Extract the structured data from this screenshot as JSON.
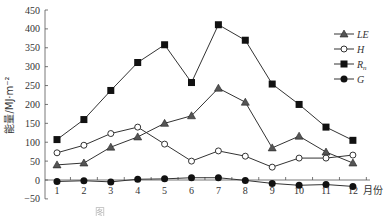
{
  "chart_data": {
    "type": "line",
    "title": "",
    "xlabel": "月份",
    "ylabel": "能量/MJ·m⁻²",
    "x": [
      1,
      2,
      3,
      4,
      5,
      6,
      7,
      8,
      9,
      10,
      11,
      12
    ],
    "categories": [
      "1",
      "2",
      "3",
      "4",
      "5",
      "6",
      "7",
      "8",
      "9",
      "10",
      "11",
      "12"
    ],
    "ylim": [
      -50,
      450
    ],
    "yticks": [
      450,
      400,
      350,
      300,
      250,
      200,
      150,
      100,
      50,
      0,
      -50
    ],
    "ytick_labels": [
      "450",
      "400",
      "350",
      "300",
      "250",
      "200",
      "150",
      "100",
      "50",
      "0",
      "−50"
    ],
    "grid": false,
    "legend_position": "upper right",
    "series": [
      {
        "name": "LE",
        "marker": "triangle",
        "values": [
          40,
          45,
          87,
          114,
          150,
          170,
          243,
          206,
          85,
          116,
          74,
          45
        ]
      },
      {
        "name": "H",
        "marker": "diamond-open",
        "values": [
          72,
          92,
          123,
          140,
          95,
          50,
          77,
          63,
          34,
          58,
          58,
          66
        ]
      },
      {
        "name": "Rn",
        "marker": "square",
        "values": [
          107,
          160,
          237,
          311,
          358,
          258,
          411,
          370,
          254,
          200,
          140,
          105
        ]
      },
      {
        "name": "G",
        "marker": "circle",
        "values": [
          -4,
          -2,
          -5,
          2,
          3,
          6,
          6,
          -1,
          -9,
          -14,
          -12,
          -17
        ]
      }
    ]
  },
  "legend": {
    "items": [
      {
        "label": "LE",
        "sub": ""
      },
      {
        "label": "H",
        "sub": ""
      },
      {
        "label": "R",
        "sub": "n"
      },
      {
        "label": "G",
        "sub": ""
      }
    ]
  },
  "caption": "图"
}
